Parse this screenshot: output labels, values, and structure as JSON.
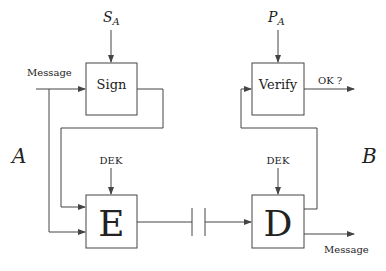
{
  "diagram": {
    "title": "",
    "parties": {
      "left": "A",
      "right": "B"
    },
    "nodes": {
      "sign": {
        "label": "Sign",
        "key": "S",
        "key_sub": "A"
      },
      "verify": {
        "label": "Verify",
        "key": "P",
        "key_sub": "A"
      },
      "encrypt": {
        "label": "E",
        "key": "DEK"
      },
      "decrypt": {
        "label": "D",
        "key": "DEK"
      }
    },
    "edges": {
      "input_message": "Message",
      "output_message": "Message",
      "verify_output": "OK ?"
    },
    "colors": {
      "line": "#444444",
      "text": "#222222",
      "background": "#ffffff"
    }
  }
}
